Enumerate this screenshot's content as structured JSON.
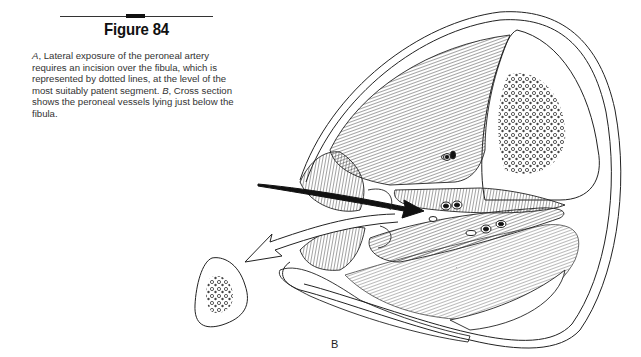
{
  "figure": {
    "title": "Figure 84",
    "caption": {
      "part_a_label": "A",
      "part_a_text": ", Lateral exposure of the peroneal artery requires an incision over the fibula, which is represented by dotted lines, at the level of the most suitably patent segment. ",
      "part_b_label": "B",
      "part_b_text": ", Cross section shows the peroneal vessels lying just below the fibula."
    },
    "panel_label": "B"
  },
  "illustration": {
    "subject": "cross-section of lower leg",
    "elements": [
      "skin-outline",
      "tibia",
      "muscle-compartments",
      "peroneal-vessels",
      "black-approach-arrow",
      "hollow-retraction-arrow",
      "resected-fibula-fragment"
    ],
    "colors": {
      "line": "#222222",
      "fill": "#ffffff",
      "arrow": "#111111"
    }
  }
}
